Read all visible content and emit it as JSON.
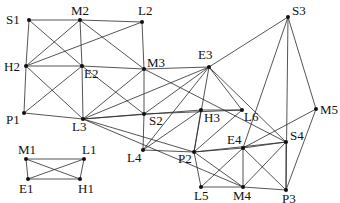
{
  "diagram": {
    "type": "graph",
    "colors": {
      "edge": "#2a2a2a",
      "node": "#111111",
      "background": "#ffffff"
    },
    "nodes": [
      {
        "id": "S1",
        "x": 29,
        "y": 20,
        "lx": 6,
        "ly": 24
      },
      {
        "id": "M2",
        "x": 80,
        "y": 20,
        "lx": 71,
        "ly": 15
      },
      {
        "id": "L2",
        "x": 142,
        "y": 22,
        "lx": 138,
        "ly": 15
      },
      {
        "id": "H2",
        "x": 26,
        "y": 66,
        "lx": 4,
        "ly": 71
      },
      {
        "id": "E2",
        "x": 82,
        "y": 66,
        "lx": 84,
        "ly": 78
      },
      {
        "id": "M3",
        "x": 144,
        "y": 69,
        "lx": 147,
        "ly": 67
      },
      {
        "id": "P1",
        "x": 24,
        "y": 113,
        "lx": 6,
        "ly": 124
      },
      {
        "id": "L3",
        "x": 83,
        "y": 119,
        "lx": 72,
        "ly": 131
      },
      {
        "id": "S2",
        "x": 144,
        "y": 114,
        "lx": 149,
        "ly": 125
      },
      {
        "id": "E3",
        "x": 209,
        "y": 67,
        "lx": 198,
        "ly": 59
      },
      {
        "id": "S3",
        "x": 288,
        "y": 17,
        "lx": 292,
        "ly": 15
      },
      {
        "id": "H3",
        "x": 201,
        "y": 110,
        "lx": 204,
        "ly": 122
      },
      {
        "id": "L6",
        "x": 242,
        "y": 110,
        "lx": 244,
        "ly": 121
      },
      {
        "id": "M5",
        "x": 316,
        "y": 109,
        "lx": 320,
        "ly": 114
      },
      {
        "id": "L4",
        "x": 143,
        "y": 150,
        "lx": 127,
        "ly": 162
      },
      {
        "id": "P2",
        "x": 194,
        "y": 152,
        "lx": 178,
        "ly": 163
      },
      {
        "id": "E4",
        "x": 243,
        "y": 148,
        "lx": 227,
        "ly": 144
      },
      {
        "id": "S4",
        "x": 286,
        "y": 142,
        "lx": 290,
        "ly": 140
      },
      {
        "id": "L5",
        "x": 201,
        "y": 187,
        "lx": 194,
        "ly": 200
      },
      {
        "id": "M4",
        "x": 243,
        "y": 187,
        "lx": 233,
        "ly": 200
      },
      {
        "id": "P3",
        "x": 286,
        "y": 190,
        "lx": 282,
        "ly": 203
      },
      {
        "id": "M1",
        "x": 26,
        "y": 159,
        "lx": 18,
        "ly": 154
      },
      {
        "id": "L1",
        "x": 84,
        "y": 159,
        "lx": 82,
        "ly": 154
      },
      {
        "id": "E1",
        "x": 28,
        "y": 179,
        "lx": 19,
        "ly": 193
      },
      {
        "id": "H1",
        "x": 80,
        "y": 179,
        "lx": 78,
        "ly": 193
      }
    ],
    "edges": [
      [
        "S1",
        "M2"
      ],
      [
        "M2",
        "L2"
      ],
      [
        "S1",
        "H2"
      ],
      [
        "S1",
        "E2"
      ],
      [
        "M2",
        "H2"
      ],
      [
        "M2",
        "E2"
      ],
      [
        "M2",
        "M3"
      ],
      [
        "L2",
        "H2"
      ],
      [
        "L2",
        "M3"
      ],
      [
        "H2",
        "E2"
      ],
      [
        "E2",
        "M3"
      ],
      [
        "H2",
        "P1"
      ],
      [
        "H2",
        "L3"
      ],
      [
        "P1",
        "E2"
      ],
      [
        "P1",
        "L3"
      ],
      [
        "E2",
        "L3"
      ],
      [
        "E2",
        "S2"
      ],
      [
        "M3",
        "L3"
      ],
      [
        "M3",
        "S2"
      ],
      [
        "M3",
        "E3"
      ],
      [
        "M3",
        "S4"
      ],
      [
        "L3",
        "S2"
      ],
      [
        "L3",
        "H3"
      ],
      [
        "L3",
        "E3"
      ],
      [
        "L3",
        "P2"
      ],
      [
        "L3",
        "M4"
      ],
      [
        "S2",
        "L4"
      ],
      [
        "S2",
        "E3"
      ],
      [
        "S2",
        "L6"
      ],
      [
        "L4",
        "H3"
      ],
      [
        "L4",
        "E3"
      ],
      [
        "L4",
        "P2"
      ],
      [
        "E3",
        "L6"
      ],
      [
        "E3",
        "P2"
      ],
      [
        "E3",
        "S4"
      ],
      [
        "E3",
        "S3"
      ],
      [
        "H3",
        "L6"
      ],
      [
        "H3",
        "P2"
      ],
      [
        "L6",
        "P2"
      ],
      [
        "S3",
        "E4"
      ],
      [
        "S3",
        "P3"
      ],
      [
        "S3",
        "M5"
      ],
      [
        "M5",
        "E4"
      ],
      [
        "M5",
        "P3"
      ],
      [
        "P2",
        "E4"
      ],
      [
        "P2",
        "S4"
      ],
      [
        "P2",
        "L5"
      ],
      [
        "P2",
        "M4"
      ],
      [
        "E4",
        "S4"
      ],
      [
        "E4",
        "L5"
      ],
      [
        "E4",
        "M4"
      ],
      [
        "E4",
        "P3"
      ],
      [
        "S4",
        "M4"
      ],
      [
        "S4",
        "P3"
      ],
      [
        "L5",
        "M4"
      ],
      [
        "M4",
        "P3"
      ],
      [
        "M1",
        "L1"
      ],
      [
        "M1",
        "E1"
      ],
      [
        "M1",
        "H1"
      ],
      [
        "L1",
        "E1"
      ],
      [
        "L1",
        "H1"
      ],
      [
        "E1",
        "H1"
      ]
    ]
  }
}
